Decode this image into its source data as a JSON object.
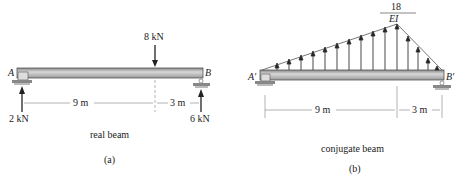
{
  "figure_a": {
    "point_load": "8 kN",
    "support_left": "A",
    "support_right": "B",
    "reaction_left": "2 kN",
    "reaction_right": "6 kN",
    "dim_left": "9 m",
    "dim_right": "3 m",
    "caption": "real beam",
    "label": "(a)"
  },
  "figure_b": {
    "peak_num": "18",
    "peak_den": "EI",
    "support_left": "A′",
    "support_right": "B′",
    "dim_left": "9 m",
    "dim_right": "3 m",
    "caption": "conjugate beam",
    "label": "(b)"
  }
}
